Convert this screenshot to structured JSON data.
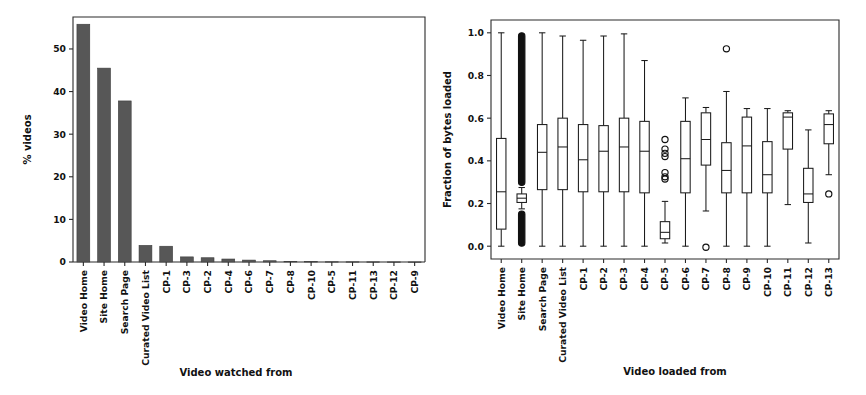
{
  "figure": {
    "background": "#ffffff",
    "bar_color": "#575757",
    "line_color": "#1b1b1b",
    "panels": [
      "bar-chart-videos-watched-from",
      "boxplot-fraction-bytes-loaded"
    ]
  },
  "chart_data": [
    {
      "type": "bar",
      "title": "",
      "xlabel": "Video watched from",
      "ylabel": "% videos",
      "ylim": [
        0,
        57.5
      ],
      "yticks": [
        0,
        10,
        20,
        30,
        40,
        50
      ],
      "ytick_labels": [
        "0",
        "10",
        "20",
        "30",
        "40",
        "50"
      ],
      "grid": false,
      "legend": "none",
      "categories": [
        "Video Home",
        "Site Home",
        "Search Page",
        "Curated Video List",
        "CP-1",
        "CP-3",
        "CP-2",
        "CP-4",
        "CP-6",
        "CP-7",
        "CP-8",
        "CP-10",
        "CP-5",
        "CP-11",
        "CP-13",
        "CP-12",
        "CP-9"
      ],
      "values": [
        55.8,
        45.5,
        37.8,
        3.9,
        3.7,
        1.2,
        1.0,
        0.7,
        0.45,
        0.3,
        0.15,
        0.08,
        0.06,
        0.05,
        0.04,
        0.03,
        0.02
      ]
    },
    {
      "type": "boxplot",
      "title": "",
      "xlabel": "Video loaded from",
      "ylabel": "Fraction of bytes loaded",
      "ylim": [
        -0.06,
        1.06
      ],
      "yticks": [
        0.0,
        0.2,
        0.4,
        0.6,
        0.8,
        1.0
      ],
      "ytick_labels": [
        "0.0",
        "0.2",
        "0.4",
        "0.6",
        "0.8",
        "1.0"
      ],
      "grid": false,
      "legend": "none",
      "categories": [
        "Video Home",
        "Site Home",
        "Search Page",
        "Curated Video List",
        "CP-1",
        "CP-2",
        "CP-3",
        "CP-4",
        "CP-5",
        "CP-6",
        "CP-7",
        "CP-8",
        "CP-9",
        "CP-10",
        "CP-11",
        "CP-12",
        "CP-13"
      ],
      "boxes": [
        {
          "label": "Video Home",
          "whisker_low": 0.0,
          "q1": 0.08,
          "median": 0.255,
          "q3": 0.505,
          "whisker_high": 1.0,
          "fliers": []
        },
        {
          "label": "Site Home",
          "whisker_low": 0.175,
          "q1": 0.205,
          "median": 0.225,
          "q3": 0.245,
          "whisker_high": 0.275,
          "fliers_dense": [
            {
              "from": 0.285,
              "to": 1.0
            },
            {
              "from": 0.0,
              "to": 0.165
            }
          ],
          "fliers": []
        },
        {
          "label": "Search Page",
          "whisker_low": 0.0,
          "q1": 0.265,
          "median": 0.44,
          "q3": 0.57,
          "whisker_high": 1.0,
          "fliers": []
        },
        {
          "label": "Curated Video List",
          "whisker_low": 0.0,
          "q1": 0.265,
          "median": 0.465,
          "q3": 0.6,
          "whisker_high": 0.985,
          "fliers": []
        },
        {
          "label": "CP-1",
          "whisker_low": 0.0,
          "q1": 0.255,
          "median": 0.405,
          "q3": 0.57,
          "whisker_high": 0.965,
          "fliers": []
        },
        {
          "label": "CP-2",
          "whisker_low": 0.0,
          "q1": 0.255,
          "median": 0.445,
          "q3": 0.565,
          "whisker_high": 0.985,
          "fliers": []
        },
        {
          "label": "CP-3",
          "whisker_low": 0.0,
          "q1": 0.255,
          "median": 0.465,
          "q3": 0.6,
          "whisker_high": 0.995,
          "fliers": []
        },
        {
          "label": "CP-4",
          "whisker_low": 0.0,
          "q1": 0.25,
          "median": 0.445,
          "q3": 0.585,
          "whisker_high": 0.87,
          "fliers": []
        },
        {
          "label": "CP-5",
          "whisker_low": 0.015,
          "q1": 0.035,
          "median": 0.065,
          "q3": 0.115,
          "whisker_high": 0.21,
          "fliers": [
            0.5,
            0.455,
            0.435,
            0.42,
            0.345,
            0.325,
            0.315
          ]
        },
        {
          "label": "CP-6",
          "whisker_low": 0.0,
          "q1": 0.25,
          "median": 0.41,
          "q3": 0.585,
          "whisker_high": 0.695,
          "fliers": []
        },
        {
          "label": "CP-7",
          "whisker_low": 0.165,
          "q1": 0.38,
          "median": 0.5,
          "q3": 0.625,
          "whisker_high": 0.65,
          "fliers": [
            -0.005
          ]
        },
        {
          "label": "CP-8",
          "whisker_low": 0.0,
          "q1": 0.25,
          "median": 0.355,
          "q3": 0.485,
          "whisker_high": 0.725,
          "fliers": [
            0.925
          ]
        },
        {
          "label": "CP-9",
          "whisker_low": 0.0,
          "q1": 0.25,
          "median": 0.47,
          "q3": 0.605,
          "whisker_high": 0.645,
          "fliers": []
        },
        {
          "label": "CP-10",
          "whisker_low": 0.0,
          "q1": 0.25,
          "median": 0.335,
          "q3": 0.49,
          "whisker_high": 0.645,
          "fliers": []
        },
        {
          "label": "CP-11",
          "whisker_low": 0.195,
          "q1": 0.455,
          "median": 0.605,
          "q3": 0.625,
          "whisker_high": 0.635,
          "fliers": []
        },
        {
          "label": "CP-12",
          "whisker_low": 0.015,
          "q1": 0.205,
          "median": 0.245,
          "q3": 0.365,
          "whisker_high": 0.545,
          "fliers": []
        },
        {
          "label": "CP-13",
          "whisker_low": 0.335,
          "q1": 0.48,
          "median": 0.57,
          "q3": 0.62,
          "whisker_high": 0.635,
          "fliers": [
            0.245
          ]
        }
      ]
    }
  ]
}
